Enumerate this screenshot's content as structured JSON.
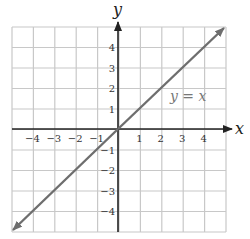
{
  "chart_data": {
    "type": "line",
    "title": "",
    "xlabel": "x",
    "ylabel": "y",
    "xlim": [
      -5,
      5
    ],
    "ylim": [
      -5,
      5
    ],
    "grid": true,
    "x_ticks": [
      -4,
      -3,
      -2,
      -1,
      1,
      2,
      3,
      4
    ],
    "y_ticks": [
      -4,
      -3,
      -2,
      -1,
      1,
      2,
      3,
      4
    ],
    "series": [
      {
        "name": "y = x",
        "x": [
          -5,
          5
        ],
        "y": [
          -5,
          5
        ],
        "color": "#6e6e6e",
        "arrows": "both"
      }
    ],
    "annotations": [
      {
        "text": "y = x",
        "x": 3.6,
        "y": 1.7
      }
    ]
  },
  "labels": {
    "x_axis": "x",
    "y_axis": "y",
    "equation": "y = x",
    "x_ticks": [
      "−4",
      "−3",
      "−2",
      "−1",
      "1",
      "2",
      "3",
      "4"
    ],
    "y_ticks": [
      "4",
      "3",
      "2",
      "1",
      "−1",
      "−2",
      "−3",
      "−4"
    ]
  },
  "colors": {
    "grid": "#c8c8c8",
    "axis": "#222222",
    "line": "#6e6e6e"
  }
}
